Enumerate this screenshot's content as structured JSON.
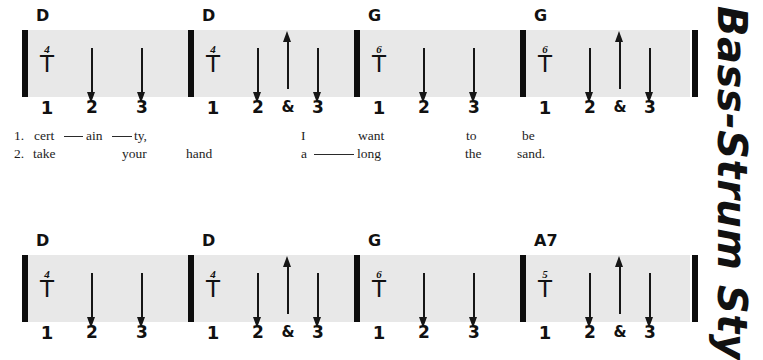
{
  "running_head": "Bass-Strum Sty",
  "colors": {
    "staff_band": "#e8e8e8",
    "ink": "#111111",
    "page": "#ffffff"
  },
  "systems": [
    {
      "id": "system-1",
      "measures": [
        {
          "chord": "D",
          "fret": "4",
          "bass_symbol": "T",
          "beats": [
            "1",
            "2",
            "3"
          ],
          "strums": [
            {
              "beat": "2",
              "direction": "down"
            },
            {
              "beat": "3",
              "direction": "down"
            }
          ]
        },
        {
          "chord": "D",
          "fret": "4",
          "bass_symbol": "T",
          "beats": [
            "1",
            "2",
            "&",
            "3"
          ],
          "strums": [
            {
              "beat": "2",
              "direction": "down"
            },
            {
              "beat": "&",
              "direction": "up"
            },
            {
              "beat": "3",
              "direction": "down"
            }
          ]
        },
        {
          "chord": "G",
          "fret": "6",
          "bass_symbol": "T",
          "beats": [
            "1",
            "2",
            "3"
          ],
          "strums": [
            {
              "beat": "2",
              "direction": "down"
            },
            {
              "beat": "3",
              "direction": "down"
            }
          ]
        },
        {
          "chord": "G",
          "fret": "6",
          "bass_symbol": "T",
          "beats": [
            "1",
            "2",
            "&",
            "3"
          ],
          "strums": [
            {
              "beat": "2",
              "direction": "down"
            },
            {
              "beat": "&",
              "direction": "up"
            },
            {
              "beat": "3",
              "direction": "down"
            }
          ]
        }
      ]
    },
    {
      "id": "system-2",
      "measures": [
        {
          "chord": "D",
          "fret": "4",
          "bass_symbol": "T",
          "beats": [
            "1",
            "2",
            "3"
          ],
          "strums": [
            {
              "beat": "2",
              "direction": "down"
            },
            {
              "beat": "3",
              "direction": "down"
            }
          ]
        },
        {
          "chord": "D",
          "fret": "4",
          "bass_symbol": "T",
          "beats": [
            "1",
            "2",
            "&",
            "3"
          ],
          "strums": [
            {
              "beat": "2",
              "direction": "down"
            },
            {
              "beat": "&",
              "direction": "up"
            },
            {
              "beat": "3",
              "direction": "down"
            }
          ]
        },
        {
          "chord": "G",
          "fret": "6",
          "bass_symbol": "T",
          "beats": [
            "1",
            "2",
            "3"
          ],
          "strums": [
            {
              "beat": "2",
              "direction": "down"
            },
            {
              "beat": "3",
              "direction": "down"
            }
          ]
        },
        {
          "chord": "A7",
          "fret": "5",
          "bass_symbol": "T",
          "beats": [
            "1",
            "2",
            "&",
            "3"
          ],
          "strums": [
            {
              "beat": "2",
              "direction": "down"
            },
            {
              "beat": "&",
              "direction": "up"
            },
            {
              "beat": "3",
              "direction": "down"
            }
          ]
        }
      ]
    }
  ],
  "lyrics": [
    {
      "id": "lyrics-1",
      "verses": [
        {
          "number": "1.",
          "words": [
            "cert",
            "ain",
            "ty,",
            "I",
            "want",
            "to",
            "be"
          ],
          "has_melisma": true
        },
        {
          "number": "2.",
          "words": [
            "take",
            "your",
            "hand",
            "a",
            "long",
            "the",
            "sand."
          ],
          "has_melisma": true
        }
      ]
    }
  ]
}
